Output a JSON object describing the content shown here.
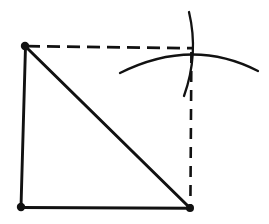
{
  "figure": {
    "title": "Geometric construction sketch",
    "background_color": "#ffffff",
    "ink_color": "#111111",
    "canvas": {
      "width": 269,
      "height": 224
    },
    "stroke_widths": {
      "solid": 2.8,
      "dashed": 2.6,
      "arc": 2.2
    },
    "dash_pattern": {
      "horizontal": "13 7",
      "vertical": "11 8"
    },
    "points": {
      "top_left": {
        "label": "A",
        "x": 25,
        "y": 46
      },
      "bottom_left": {
        "label": "B",
        "x": 21,
        "y": 207
      },
      "bottom_right": {
        "label": "C",
        "x": 190,
        "y": 208
      },
      "top_right": {
        "label": "D",
        "x": 192,
        "y": 48
      }
    },
    "vertex_dots": [
      {
        "name": "vertex-dot-top-left",
        "x": 25,
        "y": 46,
        "r": 4.2
      },
      {
        "name": "vertex-dot-bottom-left",
        "x": 21,
        "y": 207,
        "r": 4.2
      },
      {
        "name": "vertex-dot-bottom-right",
        "x": 190,
        "y": 208,
        "r": 4.0
      }
    ],
    "solid_edges": [
      {
        "name": "left-edge",
        "d": "M 25.5 46.5 L 21 207",
        "width": 2.9
      },
      {
        "name": "bottom-edge",
        "d": "M 21 207.5 L 190 208.3",
        "width": 3.0
      },
      {
        "name": "diagonal-edge",
        "d": "M 26 47 L 189.5 207.5",
        "width": 3.0
      }
    ],
    "dashed_edges": [
      {
        "name": "top-construction-line",
        "d": "M 27 46.2 L 192 48.2",
        "width": 2.8,
        "dash": "13 7"
      },
      {
        "name": "right-construction-line",
        "d": "M 191.4 52 L 190.4 205",
        "width": 2.6,
        "dash": "11 8"
      }
    ],
    "arcs": [
      {
        "name": "horizontal-compass-arc",
        "d": "M 120 73 Q 192 37 258 71",
        "width": 2.3
      },
      {
        "name": "vertical-compass-arc",
        "d": "M 189 12 Q 199 54 184 96",
        "width": 2.3
      }
    ],
    "intersection": {
      "name": "arc-intersection-point",
      "x": 192,
      "y": 48
    }
  }
}
